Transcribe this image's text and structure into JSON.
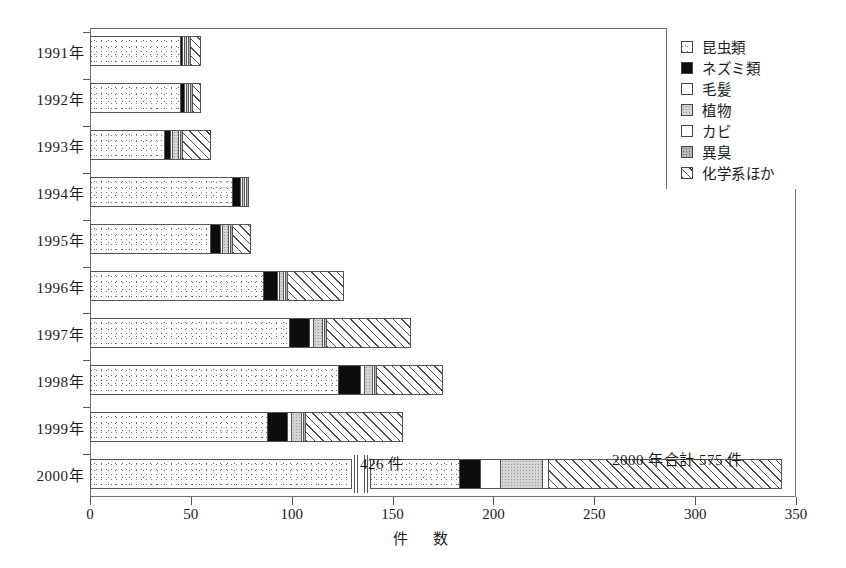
{
  "chart_data": {
    "type": "bar",
    "orientation": "horizontal",
    "stacked": true,
    "title": "",
    "xlabel": "件　数",
    "ylabel": "",
    "xlim": [
      0,
      350
    ],
    "xticks": [
      0,
      50,
      100,
      150,
      200,
      250,
      300,
      350
    ],
    "grid": false,
    "legend_position": "top-right",
    "axis_break": {
      "present": true,
      "note": "2000年 bar x-axis compressed between ~126 and ~128"
    },
    "categories": [
      "1991年",
      "1992年",
      "1993年",
      "1994年",
      "1995年",
      "1996年",
      "1997年",
      "1998年",
      "1999年",
      "2000年"
    ],
    "series": [
      {
        "name": "昆虫類",
        "values": [
          45,
          45,
          37,
          71,
          60,
          86,
          99,
          123,
          88,
          426
        ]
      },
      {
        "name": "ネズミ類",
        "values": [
          1,
          2,
          3,
          4,
          5,
          7,
          10,
          11,
          10,
          10
        ]
      },
      {
        "name": "毛髪",
        "values": [
          1,
          1,
          1,
          1,
          1,
          1,
          2,
          2,
          2,
          9
        ]
      },
      {
        "name": "植物",
        "values": [
          1,
          1,
          3,
          1,
          3,
          2,
          4,
          4,
          5,
          4
        ]
      },
      {
        "name": "カビ",
        "values": [
          1,
          1,
          1,
          1,
          1,
          1,
          1,
          1,
          1,
          1
        ]
      },
      {
        "name": "異臭",
        "values": [
          1,
          1,
          1,
          1,
          1,
          1,
          1,
          1,
          1,
          19
        ]
      },
      {
        "name": "化学系ほか",
        "values": [
          5,
          4,
          14,
          0,
          9,
          28,
          42,
          33,
          48,
          106
        ]
      }
    ],
    "annotations": [
      {
        "text": "426 件",
        "note": "昆虫類 count for 2000年"
      },
      {
        "text": "2000 年合計 575 件",
        "note": "total for 2000年"
      }
    ]
  },
  "legend": {
    "items": [
      {
        "label": "昆虫類",
        "swatch": "dotted-light-swatch"
      },
      {
        "label": "ネズミ類",
        "swatch": "solid-black-swatch"
      },
      {
        "label": "毛髪",
        "swatch": "white-swatch"
      },
      {
        "label": "植物",
        "swatch": "light-gray-swatch"
      },
      {
        "label": "カビ",
        "swatch": "white-swatch"
      },
      {
        "label": "異臭",
        "swatch": "dark-gray-dotted-swatch"
      },
      {
        "label": "化学系ほか",
        "swatch": "diagonal-hatch-swatch"
      }
    ]
  },
  "axis": {
    "x_title": "件　数",
    "x_tick_labels": [
      "0",
      "50",
      "100",
      "150",
      "200",
      "250",
      "300",
      "350"
    ],
    "y_tick_labels": [
      "1991年",
      "1992年",
      "1993年",
      "1994年",
      "1995年",
      "1996年",
      "1997年",
      "1998年",
      "1999年",
      "2000年"
    ]
  },
  "annotations": {
    "insects_2000": "426 件",
    "total_2000": "2000 年合計 575 件"
  },
  "colors": {
    "axis": "#6e6e6e",
    "text": "#1a1a1a",
    "rat_fill": "#0d0d0d",
    "plant_fill": "#d4d4d4",
    "odor_fill": "#b4b4b4",
    "hatch_line": "#4a4a4a"
  }
}
